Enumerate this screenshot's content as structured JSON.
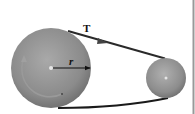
{
  "diagram": {
    "labels": {
      "tension": "T",
      "radius": "r"
    },
    "elements": {
      "large_pulley": {
        "cx": 51,
        "cy": 68,
        "r": 40
      },
      "small_pulley": {
        "cx": 166,
        "cy": 78,
        "r": 20
      },
      "belt": {
        "color": "#222222"
      },
      "pulley_color": "#8a8a8a"
    }
  }
}
